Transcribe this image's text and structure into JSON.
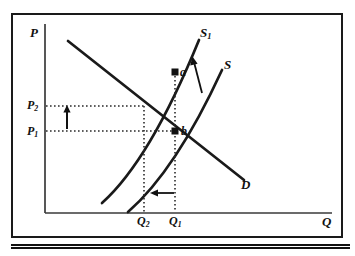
{
  "figure": {
    "type": "supply-demand-diagram",
    "axes": {
      "y_label": "P",
      "x_label": "Q"
    },
    "curves": [
      {
        "id": "S1",
        "label": "S",
        "sub": "1",
        "role": "new-supply",
        "label_x": 200,
        "label_y": 26
      },
      {
        "id": "S",
        "label": "S",
        "sub": "",
        "role": "original-supply",
        "label_x": 224,
        "label_y": 58
      },
      {
        "id": "D",
        "label": "D",
        "sub": "",
        "role": "demand",
        "label_x": 241,
        "label_y": 178
      }
    ],
    "points": [
      {
        "id": "a",
        "label": "a",
        "x": 175,
        "y": 72,
        "meaning": "point on new supply curve above original equilibrium"
      },
      {
        "id": "b",
        "label": "b",
        "x": 175,
        "y": 131,
        "meaning": "original equilibrium (Q1, P1)"
      }
    ],
    "ticks": {
      "price": [
        {
          "label": "P",
          "sub": "2",
          "value_y": 106,
          "note": "higher price after supply shift"
        },
        {
          "label": "P",
          "sub": "1",
          "value_y": 131,
          "note": "original price"
        }
      ],
      "quantity": [
        {
          "label": "Q",
          "sub": "2",
          "value_x": 144,
          "note": "lower quantity after supply shift"
        },
        {
          "label": "Q",
          "sub": "1",
          "value_x": 175,
          "note": "original quantity"
        }
      ]
    },
    "annotations": [
      {
        "id": "price-up-arrow",
        "direction": "up",
        "from_y": 131,
        "to_y": 106,
        "x": 67,
        "meaning": "price rises from P1 to P2"
      },
      {
        "id": "quantity-left-arrow",
        "direction": "left",
        "from_x": 175,
        "to_x": 151,
        "y": 193,
        "meaning": "quantity falls from Q1 to Q2"
      },
      {
        "id": "supply-shift-arrow",
        "direction": "up-left",
        "from_x": 201,
        "from_y": 92,
        "to_x": 192,
        "to_y": 58,
        "meaning": "supply curve shifts left from S to S1"
      }
    ],
    "colors": {
      "ink": "#111111",
      "curve": "#1a1a1a",
      "axis": "#3a3a3a",
      "guide": "#2a2a2a",
      "background": "#ffffff"
    }
  }
}
